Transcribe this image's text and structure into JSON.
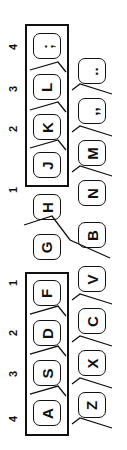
{
  "diagram": {
    "orientation": "rotated-90-ccw",
    "finger_numbers": [
      {
        "label": "4",
        "x": 6,
        "y": 40
      },
      {
        "label": "3",
        "x": 6,
        "y": 82
      },
      {
        "label": "2",
        "x": 6,
        "y": 122
      },
      {
        "label": "1",
        "x": 6,
        "y": 183
      },
      {
        "label": "1",
        "x": 6,
        "y": 276
      },
      {
        "label": "2",
        "x": 6,
        "y": 326
      },
      {
        "label": "3",
        "x": 6,
        "y": 367
      },
      {
        "label": "4",
        "x": 6,
        "y": 412
      }
    ],
    "home_row": [
      {
        "label": ";",
        "glyph": ";",
        "x": 33,
        "y": 33
      },
      {
        "label": "L",
        "glyph": "L",
        "x": 33,
        "y": 74
      },
      {
        "label": "K",
        "glyph": "K",
        "x": 33,
        "y": 114
      },
      {
        "label": "J",
        "glyph": "J",
        "x": 33,
        "y": 152
      },
      {
        "label": "H",
        "glyph": "H",
        "x": 33,
        "y": 194
      },
      {
        "label": "G",
        "glyph": "G",
        "x": 33,
        "y": 234
      },
      {
        "label": "F",
        "glyph": "F",
        "x": 33,
        "y": 280
      },
      {
        "label": "D",
        "glyph": "D",
        "x": 33,
        "y": 320
      },
      {
        "label": "S",
        "glyph": "S",
        "x": 33,
        "y": 360
      },
      {
        "label": "A",
        "glyph": "A",
        "x": 33,
        "y": 400
      }
    ],
    "bottom_row": [
      {
        "label": ".",
        "glyph": "..",
        "x": 78,
        "y": 58
      },
      {
        "label": ",",
        "glyph": ",,",
        "x": 78,
        "y": 98
      },
      {
        "label": "M",
        "glyph": "M",
        "x": 78,
        "y": 140
      },
      {
        "label": "N",
        "glyph": "N",
        "x": 78,
        "y": 180
      },
      {
        "label": "B",
        "glyph": "B",
        "x": 78,
        "y": 222
      },
      {
        "label": "V",
        "glyph": "V",
        "x": 78,
        "y": 266
      },
      {
        "label": "C",
        "glyph": "C",
        "x": 78,
        "y": 308
      },
      {
        "label": "X",
        "glyph": "X",
        "x": 78,
        "y": 350
      },
      {
        "label": "Z",
        "glyph": "Z",
        "x": 78,
        "y": 392
      }
    ],
    "groups": [
      {
        "name": "right-hand-home-keys",
        "x": 25,
        "y": 24,
        "w": 44,
        "h": 163
      },
      {
        "name": "left-hand-home-keys",
        "x": 25,
        "y": 272,
        "w": 44,
        "h": 164
      }
    ],
    "colors": {
      "ink": "#111111",
      "background": "#ffffff"
    }
  }
}
